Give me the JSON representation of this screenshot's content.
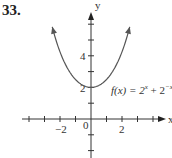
{
  "problem_number": "33.",
  "chart_data": {
    "type": "line",
    "title": "",
    "function_label": "f(x) = 2^x + 2^-x",
    "function_label_parts": {
      "lhs": "f(x) = 2",
      "exp1": "x",
      "mid": " + 2",
      "exp2": "−x"
    },
    "xlabel": "x",
    "ylabel": "y",
    "x_tick_labels": [
      "−2",
      "0",
      "2"
    ],
    "y_tick_labels": [
      "2",
      "4"
    ],
    "xlim": [
      -4,
      4
    ],
    "ylim": [
      -2,
      6
    ],
    "grid": false,
    "series": [
      {
        "name": "f(x) = 2^x + 2^-x",
        "x": [
          -2.5,
          -2,
          -1.5,
          -1,
          -0.5,
          0,
          0.5,
          1,
          1.5,
          2,
          2.5
        ],
        "y": [
          5.83,
          4.25,
          3.18,
          2.5,
          2.12,
          2.0,
          2.12,
          2.5,
          3.18,
          4.25,
          5.83
        ]
      }
    ]
  }
}
